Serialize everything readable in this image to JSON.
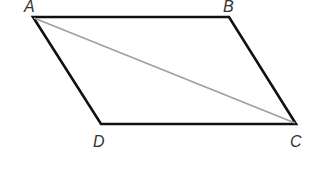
{
  "diagram": {
    "type": "parallelogram",
    "vertices": [
      {
        "label": "A",
        "x": 33,
        "y": 17,
        "label_x": 24,
        "label_y": 12
      },
      {
        "label": "B",
        "x": 229,
        "y": 17,
        "label_x": 223,
        "label_y": 12
      },
      {
        "label": "C",
        "x": 296,
        "y": 124,
        "label_x": 290,
        "label_y": 147
      },
      {
        "label": "D",
        "x": 101,
        "y": 124,
        "label_x": 93,
        "label_y": 147
      }
    ],
    "diagonal": {
      "from": "A",
      "to": "C"
    },
    "colors": {
      "edge": "#111111",
      "diagonal": "#a0a0a0",
      "label": "#333333"
    }
  }
}
